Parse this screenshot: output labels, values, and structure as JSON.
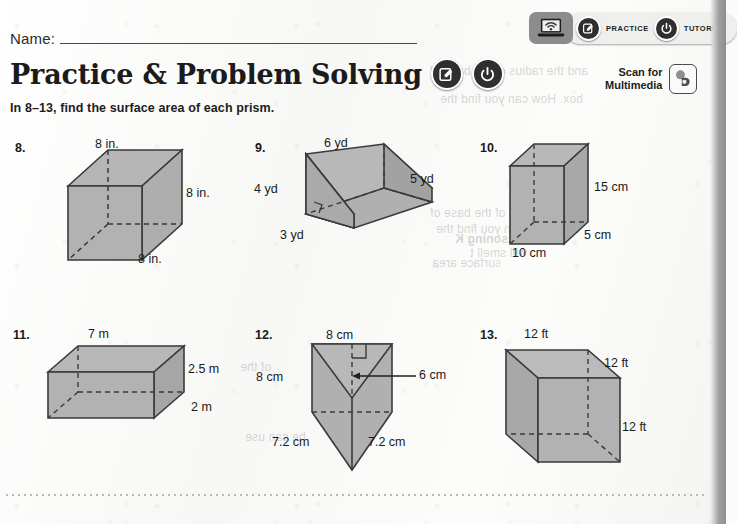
{
  "worksheet": {
    "name_label": "Name:",
    "title": "Practice & Problem Solving",
    "instructions": "In 8–13, find the surface area of each prism."
  },
  "digital_bar": {
    "laptop_icon": "laptop-wifi-icon",
    "links": [
      {
        "label": "PRACTICE",
        "icon": "pencil-square-icon"
      },
      {
        "label": "TUTORIAL",
        "icon": "power-icon"
      }
    ]
  },
  "title_badges": [
    {
      "icon": "pencil-square-icon"
    },
    {
      "icon": "power-icon"
    }
  ],
  "scan": {
    "line1": "Scan for",
    "line2": "Multimedia",
    "icon": "scan-code-icon"
  },
  "colors": {
    "shape_fill": "#adadad",
    "shape_fill_light": "#bdbdbd",
    "shape_fill_dark": "#9d9d9d",
    "outline": "#3a3a3a",
    "text": "#1a1a1a",
    "page_background": "#fbfbfa"
  },
  "problems": [
    {
      "number": "8.",
      "shape": "cube",
      "labels": {
        "top": "8 in.",
        "right": "8 in.",
        "depth": "8 in."
      }
    },
    {
      "number": "9.",
      "shape": "triangular-prism-wedge",
      "labels": {
        "top": "6 yd",
        "slant": "5 yd",
        "height": "4 yd",
        "base": "3 yd"
      }
    },
    {
      "number": "10.",
      "shape": "rectangular-prism",
      "labels": {
        "height": "15 cm",
        "depth": "5 cm",
        "width": "10 cm"
      }
    },
    {
      "number": "11.",
      "shape": "rectangular-prism",
      "labels": {
        "length": "7 m",
        "height": "2.5 m",
        "depth": "2 m"
      }
    },
    {
      "number": "12.",
      "shape": "triangular-prism-down",
      "labels": {
        "top": "8 cm",
        "left": "8 cm",
        "altitude": "6 cm",
        "slant_left": "7.2 cm",
        "slant_right": "7.2 cm"
      }
    },
    {
      "number": "13.",
      "shape": "cube",
      "labels": {
        "top": "12 ft",
        "depth": "12 ft",
        "right": "12 ft"
      }
    }
  ],
  "bleed_through": [
    "and the radius of the base of",
    "box. How can you find the",
    "Reasoning K",
    "will smell t",
    "surface area",
    "of the",
    "he can use"
  ]
}
